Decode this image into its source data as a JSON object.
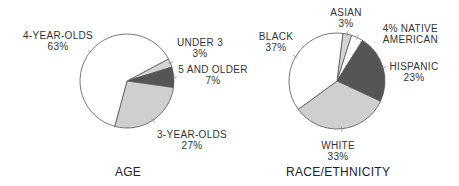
{
  "chart_data": [
    {
      "type": "pie",
      "title": "AGE",
      "start_angle_deg": -28,
      "direction": "clockwise",
      "categories": [
        "UNDER 3",
        "5 AND OLDER",
        "3-YEAR-OLDS",
        "4-YEAR-OLDS"
      ],
      "values": [
        3,
        7,
        27,
        63
      ],
      "value_labels": [
        "3%",
        "7%",
        "27%",
        "63%"
      ],
      "colors": [
        "#d4d4d4",
        "#555555",
        "#cfcfcf",
        "#ffffff"
      ],
      "center": [
        127,
        81
      ],
      "radius": 47
    },
    {
      "type": "pie",
      "title": "RACE/ETHNICITY",
      "start_angle_deg": -83,
      "direction": "clockwise",
      "categories": [
        "ASIAN",
        "NATIVE AMERICAN",
        "HISPANIC",
        "WHITE",
        "BLACK"
      ],
      "values": [
        3,
        4,
        23,
        33,
        37
      ],
      "value_labels": [
        "3%",
        "4%",
        "23%",
        "33%",
        "37%"
      ],
      "colors": [
        "#d4d4d4",
        "#ffffff",
        "#555555",
        "#cfcfcf",
        "#ffffff"
      ],
      "center": [
        337,
        81
      ],
      "radius": 48
    }
  ],
  "age": {
    "title": "AGE",
    "labels": {
      "four_year": {
        "name": "4-YEAR-OLDS",
        "pct": "63%"
      },
      "under3": {
        "name": "UNDER 3",
        "pct": "3%"
      },
      "five_older": {
        "name": "5 AND OLDER",
        "pct": "7%"
      },
      "three_year": {
        "name": "3-YEAR-OLDS",
        "pct": "27%"
      }
    }
  },
  "race": {
    "title": "RACE/ETHNICITY",
    "labels": {
      "asian": {
        "name": "ASIAN",
        "pct": "3%"
      },
      "native": {
        "pct_name": "4% NATIVE",
        "name2": "AMERICAN"
      },
      "hispanic": {
        "name": "HISPANIC",
        "pct": "23%"
      },
      "white": {
        "name": "WHITE",
        "pct": "33%"
      },
      "black": {
        "name": "BLACK",
        "pct": "37%"
      }
    }
  },
  "style": {
    "stroke": "#555555",
    "light_gray": "#d2d2d2",
    "dark_gray": "#555555",
    "white": "#ffffff"
  }
}
